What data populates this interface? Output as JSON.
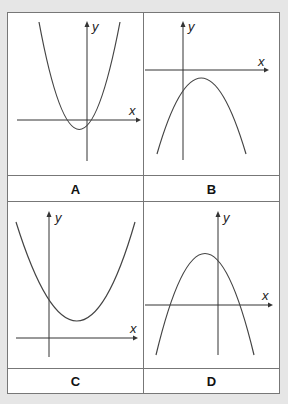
{
  "panels": [
    {
      "label": "A",
      "x_axis_label": "x",
      "y_axis_label": "y",
      "description": "upward-opening parabola, vertex below x-axis slightly left of y-axis"
    },
    {
      "label": "B",
      "x_axis_label": "x",
      "y_axis_label": "y",
      "description": "downward-opening parabola, vertex below x-axis right of y-axis"
    },
    {
      "label": "C",
      "x_axis_label": "x",
      "y_axis_label": "y",
      "description": "upward-opening parabola, vertex above x-axis right of y-axis"
    },
    {
      "label": "D",
      "x_axis_label": "x",
      "y_axis_label": "y",
      "description": "downward-opening parabola, vertex above x-axis left of y-axis"
    }
  ],
  "colors": {
    "background": "#e6e6e6",
    "grid_border": "#777777",
    "curve": "#444444"
  }
}
